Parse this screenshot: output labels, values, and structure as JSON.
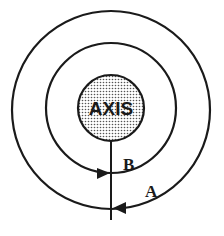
{
  "diagram": {
    "center_label": "AXIS",
    "labels": [
      {
        "id": "B",
        "text": "B"
      },
      {
        "id": "A",
        "text": "A"
      }
    ],
    "colors": {
      "stroke": "#1a1a1a",
      "background": "#ffffff",
      "axis_fill": "#d9d9d9"
    },
    "circles": [
      {
        "name": "outer-loop",
        "label": "A",
        "arrow_direction": "left"
      },
      {
        "name": "inner-loop",
        "label": "B",
        "arrow_direction": "right"
      },
      {
        "name": "axis-core",
        "label": "AXIS",
        "shaded": true
      }
    ]
  }
}
